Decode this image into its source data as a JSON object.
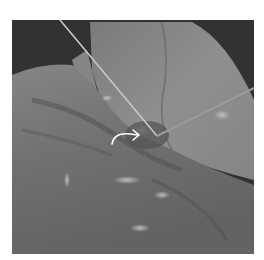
{
  "image": {
    "description": "Grayscale intraoperative photograph of tissue with two probes/wires and a white curved arrow annotation",
    "annotations": [
      {
        "type": "curved-arrow",
        "color": "#ffffff"
      }
    ],
    "colors": {
      "background_frame": "#ffffff",
      "photo_background": "#0a0a0a",
      "tissue_dark": "#3a3a3a",
      "tissue_mid": "#6e6e6e",
      "tissue_light": "#a8a8a8",
      "highlight": "#e8e8e8"
    }
  }
}
